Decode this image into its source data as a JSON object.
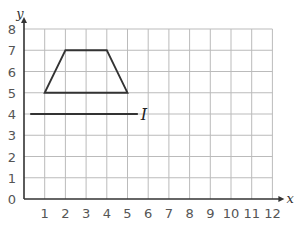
{
  "axes": {
    "x_label": "x",
    "y_label": "y",
    "x_ticks": [
      "0",
      "1",
      "2",
      "3",
      "4",
      "5",
      "6",
      "7",
      "8",
      "9",
      "10",
      "11",
      "12"
    ],
    "y_ticks": [
      "0",
      "1",
      "2",
      "3",
      "4",
      "5",
      "6",
      "7",
      "8"
    ]
  },
  "shape": {
    "name": "trapezium",
    "vertices": [
      [
        1,
        5
      ],
      [
        2,
        7
      ],
      [
        4,
        7
      ],
      [
        5,
        5
      ]
    ]
  },
  "mirror_line": {
    "label": "I",
    "y": 4,
    "x_from": 0.3,
    "x_to": 5.5
  },
  "chart_data": {
    "type": "diagram",
    "title": "",
    "xlabel": "x",
    "ylabel": "y",
    "xlim": [
      0,
      12
    ],
    "ylim": [
      0,
      8
    ],
    "grid": true,
    "shapes": [
      {
        "type": "polygon",
        "name": "trapezium",
        "points": [
          [
            1,
            5
          ],
          [
            2,
            7
          ],
          [
            4,
            7
          ],
          [
            5,
            5
          ]
        ]
      },
      {
        "type": "line",
        "name": "I",
        "points": [
          [
            0.3,
            4
          ],
          [
            5.5,
            4
          ]
        ]
      }
    ]
  }
}
